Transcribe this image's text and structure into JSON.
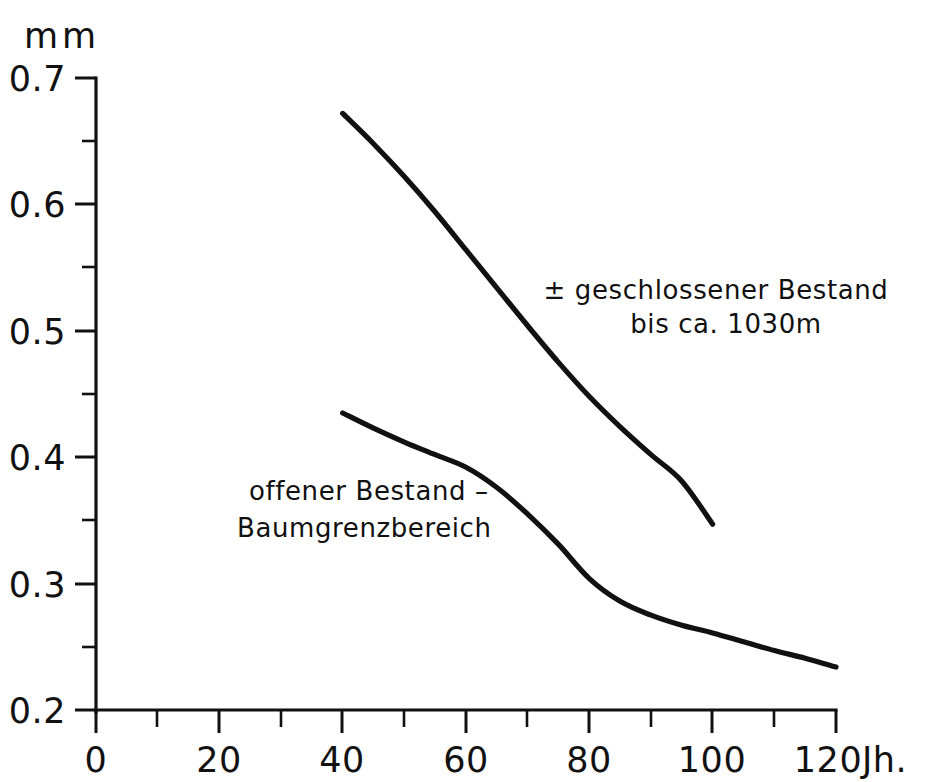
{
  "chart_data": {
    "type": "line",
    "title": "",
    "xlabel": "Jh.",
    "ylabel": "mm",
    "xlim": [
      0,
      120
    ],
    "ylim": [
      0.2,
      0.7
    ],
    "grid": false,
    "legend_position": "inline-annotations",
    "x_tick_labels": [
      "0",
      "20",
      "40",
      "60",
      "80",
      "100",
      "120"
    ],
    "x_ticks_major": [
      0,
      20,
      40,
      60,
      80,
      100,
      120
    ],
    "x_ticks_minor": [
      10,
      30,
      50,
      70,
      90,
      110
    ],
    "y_tick_labels": [
      "0.2",
      "0.3",
      "0.4",
      "0.5",
      "0.6",
      "0.7"
    ],
    "y_ticks_major": [
      0.2,
      0.3,
      0.4,
      0.5,
      0.6,
      0.7
    ],
    "y_ticks_minor": [
      0.25,
      0.35,
      0.45,
      0.55,
      0.65
    ],
    "series": [
      {
        "name": "geschlossener Bestand",
        "x": [
          40,
          45,
          50,
          55,
          60,
          65,
          70,
          75,
          80,
          85,
          90,
          95,
          100
        ],
        "values": [
          0.672,
          0.648,
          0.622,
          0.594,
          0.564,
          0.534,
          0.504,
          0.475,
          0.448,
          0.424,
          0.402,
          0.381,
          0.347
        ]
      },
      {
        "name": "offener Bestand - Baumgrenzbereich",
        "x": [
          40,
          45,
          50,
          55,
          60,
          65,
          70,
          75,
          80,
          85,
          90,
          95,
          100,
          105,
          110,
          115,
          120
        ],
        "values": [
          0.435,
          0.423,
          0.412,
          0.402,
          0.392,
          0.376,
          0.355,
          0.331,
          0.304,
          0.286,
          0.275,
          0.267,
          0.261,
          0.254,
          0.247,
          0.241,
          0.234
        ]
      }
    ],
    "annotations": [
      {
        "id": "upper-curve-label",
        "lines": [
          "± geschlossener Bestand",
          "bis ca. 1030m"
        ],
        "x": 92,
        "y": 0.545
      },
      {
        "id": "lower-curve-label",
        "lines": [
          "offener Bestand –",
          "Baumgrenzbereich"
        ],
        "x": 53,
        "y": 0.375
      }
    ],
    "colors": {
      "ink": "#111111",
      "background": "#ffffff"
    }
  },
  "axes": {
    "y_unit": "mm",
    "x_unit": "Jh.",
    "y_labels": [
      "0.7",
      "0.6",
      "0.5",
      "0.4",
      "0.3",
      "0.2"
    ],
    "x_labels": [
      "0",
      "20",
      "40",
      "60",
      "80",
      "100",
      "120"
    ]
  },
  "annotations": {
    "upper_line1": "± geschlossener Bestand",
    "upper_line2": "bis ca. 1030m",
    "lower_line1": "offener Bestand –",
    "lower_line2": "Baumgrenzbereich"
  }
}
